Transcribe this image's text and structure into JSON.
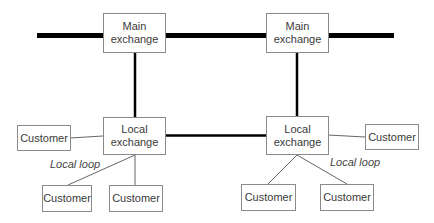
{
  "diagram": {
    "type": "telephone network hierarchy",
    "nodes": {
      "main_exchange_left": {
        "line1": "Main",
        "line2": "exchange"
      },
      "main_exchange_right": {
        "line1": "Main",
        "line2": "exchange"
      },
      "local_exchange_left": {
        "line1": "Local",
        "line2": "exchange"
      },
      "local_exchange_right": {
        "line1": "Local",
        "line2": "exchange"
      },
      "customers": [
        {
          "label": "Customer"
        },
        {
          "label": "Customer"
        },
        {
          "label": "Customer"
        },
        {
          "label": "Customer"
        },
        {
          "label": "Customer"
        },
        {
          "label": "Customer"
        }
      ]
    },
    "labels": {
      "local_loop_left": "Local loop",
      "local_loop_right": "Local loop"
    },
    "colors": {
      "trunk_line": "#000000",
      "box_border": "#8a8a8a",
      "thin_line": "#666666"
    }
  }
}
